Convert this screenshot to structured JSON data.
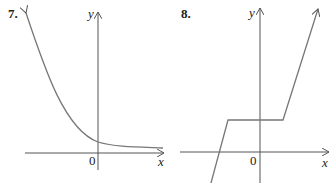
{
  "graphs": [
    {
      "number": "7.",
      "x_label": "x",
      "y_label": "y",
      "origin_label": "0",
      "description": "Decreasing exponential-like curve approaching the x-axis from above as x increases"
    },
    {
      "number": "8.",
      "x_label": "x",
      "y_label": "y",
      "origin_label": "0",
      "description": "Piecewise linear graph: steep increasing line, horizontal segment above x-axis, then steep increasing line"
    }
  ],
  "colors": {
    "axis": "#555555",
    "curve": "#777777",
    "text": "#222222"
  }
}
